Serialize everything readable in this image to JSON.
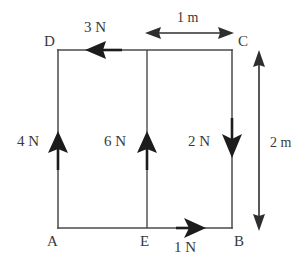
{
  "figure": {
    "type": "force-diagram",
    "background_color": "#ffffff",
    "line_color": "#4a4a4a",
    "arrow_color": "#1c1c1c"
  },
  "vertices": [
    {
      "id": "D",
      "label": "D",
      "x": 58,
      "y": 50,
      "label_x": 44,
      "label_y": 46
    },
    {
      "id": "C",
      "label": "C",
      "x": 232,
      "y": 50,
      "label_x": 238,
      "label_y": 46
    },
    {
      "id": "A",
      "label": "A",
      "x": 58,
      "y": 228,
      "label_x": 47,
      "label_y": 246
    },
    {
      "id": "B",
      "label": "B",
      "x": 232,
      "y": 228,
      "label_x": 234,
      "label_y": 246
    },
    {
      "id": "E",
      "label": "E",
      "x": 147,
      "y": 228,
      "label_x": 140,
      "label_y": 246
    }
  ],
  "forces": [
    {
      "id": "force-3n-dc",
      "label": "3 N",
      "magnitude": 3,
      "unit": "N",
      "direction": "left",
      "applied_edge": "DC",
      "label_x": 84,
      "label_y": 32
    },
    {
      "id": "force-4n-ad",
      "label": "4 N",
      "magnitude": 4,
      "unit": "N",
      "direction": "up",
      "applied_edge": "AD",
      "label_x": 17,
      "label_y": 146
    },
    {
      "id": "force-6n-e",
      "label": "6 N",
      "magnitude": 6,
      "unit": "N",
      "direction": "up",
      "applied_edge": "E-vertical",
      "label_x": 104,
      "label_y": 146
    },
    {
      "id": "force-2n-bc",
      "label": "2 N",
      "magnitude": 2,
      "unit": "N",
      "direction": "down",
      "applied_edge": "BC",
      "label_x": 188,
      "label_y": 146
    },
    {
      "id": "force-1n-ab",
      "label": "1 N",
      "magnitude": 1,
      "unit": "N",
      "direction": "right",
      "applied_edge": "AB",
      "label_x": 174,
      "label_y": 252
    }
  ],
  "dimensions": [
    {
      "id": "dim-1m-horizontal",
      "label": "1 m",
      "value": 1,
      "unit": "m",
      "orientation": "horizontal",
      "spans": "E to C",
      "label_x": 177,
      "label_y": 22
    },
    {
      "id": "dim-2m-vertical",
      "label": "2 m",
      "value": 2,
      "unit": "m",
      "orientation": "vertical",
      "spans": "C to B",
      "label_x": 270,
      "label_y": 147
    }
  ]
}
